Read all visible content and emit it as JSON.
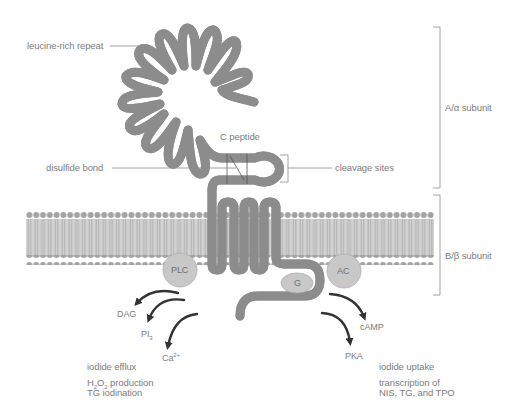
{
  "diagram": {
    "labels": {
      "leucine_rich_repeat": "leucine-rich repeat",
      "c_peptide": "C peptide",
      "disulfide_bond": "disulfide bond",
      "cleavage_sites": "cleavage sites",
      "a_subunit": "A/α subunit",
      "b_subunit": "B/β subunit"
    },
    "proteins": {
      "plc": "PLC",
      "ac": "AC",
      "g": "G"
    },
    "left_pathway": {
      "products": [
        {
          "name": "DAG"
        },
        {
          "base": "PI",
          "sub": "3"
        },
        {
          "base": "Ca",
          "sup": "2+"
        }
      ],
      "effects": {
        "line1": "iodide efflux",
        "line2_parts": {
          "h": "H",
          "sub2": "2",
          "o": "O",
          "sub3": "2",
          "rest": " production"
        },
        "line3": "TG iodination"
      }
    },
    "right_pathway": {
      "products": [
        {
          "name": "cAMP"
        },
        {
          "name": "PKA"
        }
      ],
      "effects": {
        "line1": "iodide uptake",
        "line2": "transcription of",
        "line3": "NIS, TG, and TPO"
      }
    },
    "colors": {
      "receptor_fill": "#a9a9a9",
      "receptor_edge": "#8c8c8c",
      "membrane_heads": "#a3a3a3",
      "membrane_tails": "#c9c9c9",
      "protein_fill": "#c8c8c8",
      "arrow": "#333333",
      "line": "#8a8a8a",
      "text": "#7d7d7d"
    }
  }
}
